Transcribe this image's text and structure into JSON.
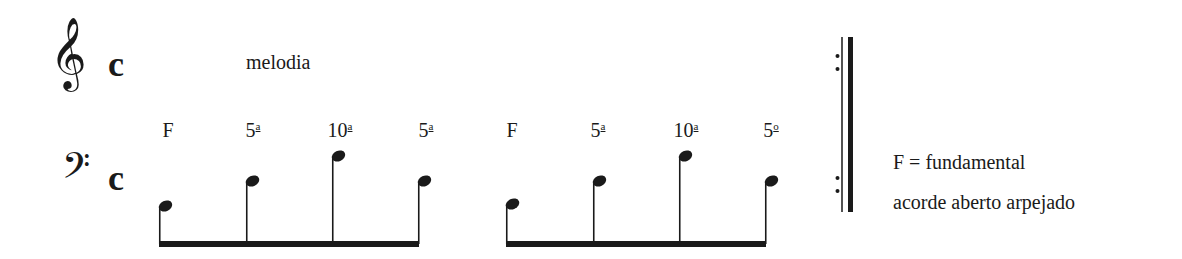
{
  "treble_staff": {
    "clef": "treble-clef",
    "clef_glyph": "𝄞",
    "time_signature": "c",
    "label": "melodia"
  },
  "bass_staff": {
    "clef": "bass-clef",
    "clef_glyph": "𝄢",
    "time_signature": "c"
  },
  "arpeggios": [
    {
      "intervals": [
        {
          "num": "F",
          "sup": ""
        },
        {
          "num": "5",
          "sup": "a"
        },
        {
          "num": "10",
          "sup": "a"
        },
        {
          "num": "5",
          "sup": "a"
        }
      ],
      "notes": [
        {
          "x": 159,
          "y": 206
        },
        {
          "x": 246,
          "y": 181
        },
        {
          "x": 332,
          "y": 156
        },
        {
          "x": 418,
          "y": 181
        }
      ],
      "beam": {
        "x1": 159,
        "x2": 419,
        "y": 244
      }
    },
    {
      "intervals": [
        {
          "num": "F",
          "sup": ""
        },
        {
          "num": "5",
          "sup": "a"
        },
        {
          "num": "10",
          "sup": "a"
        },
        {
          "num": "5",
          "sup": "o"
        }
      ],
      "notes": [
        {
          "x": 506,
          "y": 204
        },
        {
          "x": 593,
          "y": 181
        },
        {
          "x": 679,
          "y": 156
        },
        {
          "x": 765,
          "y": 181
        }
      ],
      "beam": {
        "x1": 506,
        "x2": 766,
        "y": 244
      }
    }
  ],
  "barline": {
    "type": "end-repeat",
    "top": 37,
    "bottom": 212
  },
  "legend": {
    "fundamental": "F = fundamental",
    "description": "acorde aberto arpejado"
  },
  "colors": {
    "ink": "#1a1a1a",
    "background": "#ffffff"
  }
}
